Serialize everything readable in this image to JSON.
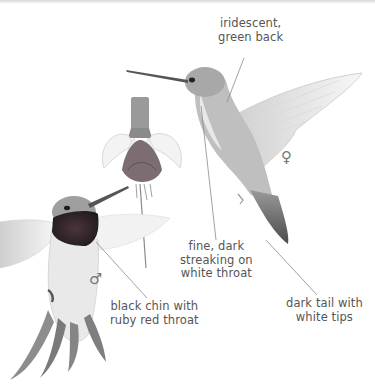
{
  "illustration": {
    "subject": "Ruby-throated hummingbirds (male and female) at a fuchsia flower",
    "labels": {
      "green_back": "iridescent,\ngreen back",
      "female_throat": "fine, dark\nstreaking on\nwhite throat",
      "male_throat": "black chin with\nruby red throat",
      "female_tail": "dark tail with\nwhite tips"
    },
    "sex_symbols": {
      "female": "♀",
      "male": "♂"
    },
    "colors": {
      "label_text": "#555555",
      "leader_line": "#888888",
      "male_throat": "#3a2a30",
      "flower_sepal": "#f4f4f4",
      "flower_corolla": "#7a6a70"
    }
  }
}
